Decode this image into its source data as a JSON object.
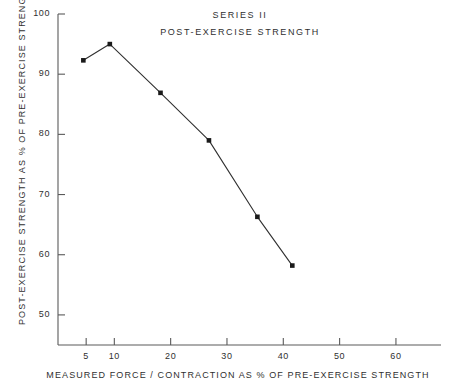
{
  "chart_data": {
    "type": "line",
    "title": "SERIES II",
    "subtitle": "POST-EXERCISE  STRENGTH",
    "xlabel": "MEASURED FORCE / CONTRACTION AS % OF PRE-EXERCISE  STRENGTH",
    "ylabel": "POST-EXERCISE  STRENGTH  AS % OF  PRE-EXERCISE  STRENGTH",
    "xlim": [
      0,
      68
    ],
    "ylim": [
      45,
      100
    ],
    "grid": false,
    "legend": false,
    "marker": "square",
    "line_color": "#303030",
    "marker_color": "#1a1a1a",
    "axis_color": "#5a5a5a",
    "background": "#ffffff",
    "x_ticks": [
      5,
      10,
      20,
      30,
      40,
      50,
      60
    ],
    "x_tick_labels": [
      "5",
      "10",
      "20",
      "30",
      "40",
      "50",
      "60"
    ],
    "y_ticks": [
      50,
      60,
      70,
      80,
      90,
      100
    ],
    "y_tick_labels": [
      "50",
      "60",
      "70",
      "80",
      "90",
      "100"
    ],
    "series": [
      {
        "name": "Series II post-exercise strength",
        "x": [
          4.5,
          9.2,
          18.2,
          26.8,
          35.4,
          41.6
        ],
        "y": [
          92.3,
          95.0,
          86.9,
          79.0,
          66.3,
          58.2
        ]
      }
    ]
  },
  "axis_titles": {
    "x": "MEASURED FORCE / CONTRACTION AS % OF PRE-EXERCISE  STRENGTH",
    "y": "POST-EXERCISE  STRENGTH  AS % OF  PRE-EXERCISE  STRENGTH"
  },
  "titles": {
    "line1": "SERIES II",
    "line2": "POST-EXERCISE  STRENGTH"
  }
}
